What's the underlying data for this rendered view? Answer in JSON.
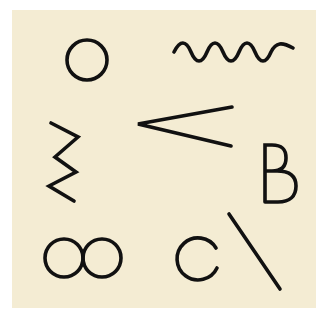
{
  "image": {
    "description": "Cream-colored card with eight black line-drawn symbols",
    "background_color": "#ffffff",
    "card_color": "#f4ecd3",
    "stroke_color": "#111111"
  },
  "symbols": [
    {
      "name": "circle",
      "label": "O"
    },
    {
      "name": "wave",
      "label": "~"
    },
    {
      "name": "less-than",
      "label": "<"
    },
    {
      "name": "zigzag",
      "label": "zigzag"
    },
    {
      "name": "letter-b",
      "label": "B"
    },
    {
      "name": "infinity",
      "label": "oo"
    },
    {
      "name": "letter-c",
      "label": "C"
    },
    {
      "name": "backslash",
      "label": "\\"
    }
  ]
}
